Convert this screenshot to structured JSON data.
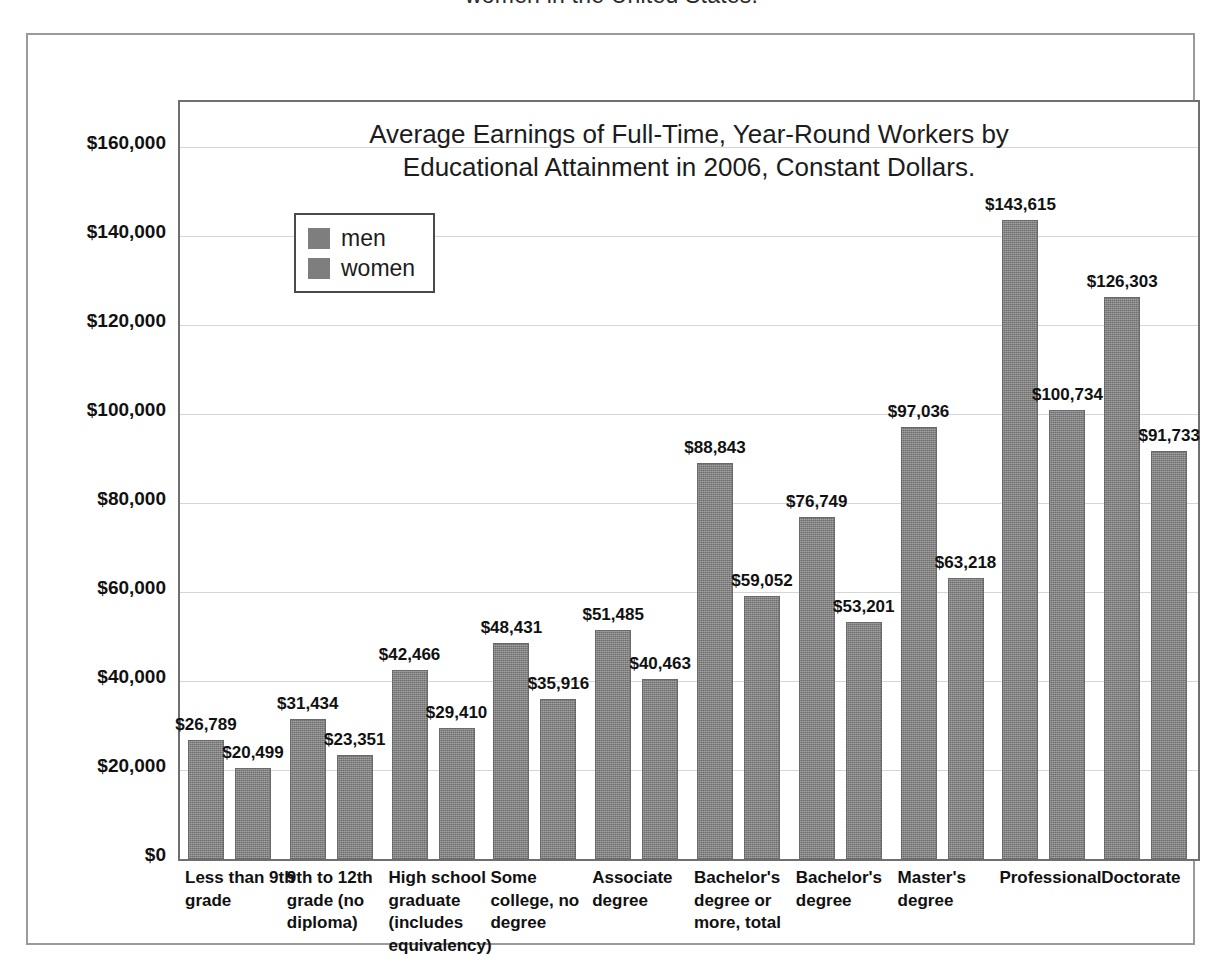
{
  "caption": {
    "clipped_line": "women in the United States."
  },
  "legend": {
    "position": "top-left-inside",
    "entries": [
      {
        "label": "men",
        "color": "#7e7e7e"
      },
      {
        "label": "women",
        "color": "#7e7e7e"
      }
    ]
  },
  "chart_data": {
    "type": "bar",
    "title": "Average Earnings of Full-Time, Year-Round Workers by Educational Attainment in 2006, Constant Dollars.",
    "title_lines": [
      "Average Earnings of Full-Time, Year-Round Workers by",
      "Educational Attainment in 2006, Constant Dollars."
    ],
    "xlabel": "",
    "ylabel": "",
    "ylim": [
      0,
      170000
    ],
    "grid": true,
    "legend_position": "top-left-inside",
    "yticks": [
      0,
      20000,
      40000,
      60000,
      80000,
      100000,
      120000,
      140000,
      160000
    ],
    "ytick_labels": [
      "$0",
      "$20,000",
      "$40,000",
      "$60,000",
      "$80,000",
      "$100,000",
      "$120,000",
      "$140,000",
      "$160,000"
    ],
    "categories": [
      "Less than 9th grade",
      "9th to 12th grade (no diploma)",
      "High school graduate (includes equivalency)",
      "Some college, no degree",
      "Associate degree",
      "Bachelor's degree or more, total",
      "Bachelor's degree",
      "Master's degree",
      "Professional",
      "Doctorate"
    ],
    "series": [
      {
        "name": "men",
        "color": "#7e7e7e",
        "values": [
          26789,
          31434,
          42466,
          48431,
          51485,
          88843,
          76749,
          97036,
          143615,
          126303
        ],
        "labels": [
          "$26,789",
          "$31,434",
          "$42,466",
          "$48,431",
          "$51,485",
          "$88,843",
          "$76,749",
          "$97,036",
          "$143,615",
          "$126,303"
        ]
      },
      {
        "name": "women",
        "color": "#7e7e7e",
        "values": [
          20499,
          23351,
          29410,
          35916,
          40463,
          59052,
          53201,
          63218,
          100734,
          91733
        ],
        "labels": [
          "$20,499",
          "$23,351",
          "$29,410",
          "$35,916",
          "$40,463",
          "$59,052",
          "$53,201",
          "$63,218",
          "$100,734",
          "$91,733"
        ]
      }
    ]
  }
}
